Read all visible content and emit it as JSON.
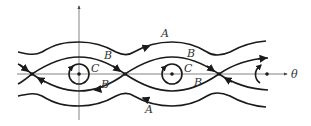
{
  "diagram": {
    "axis_labels": {
      "x": "θ"
    },
    "curve_labels": {
      "A_top": "A",
      "A_bottom": "A",
      "B_top_1": "B",
      "B_bottom_1": "B",
      "B_top_2": "B",
      "B_bottom_2": "B",
      "C_1": "C",
      "C_2": "C"
    },
    "colors": {
      "stroke": "#1a1a1a",
      "axis": "#555555",
      "background": "#ffffff"
    }
  }
}
